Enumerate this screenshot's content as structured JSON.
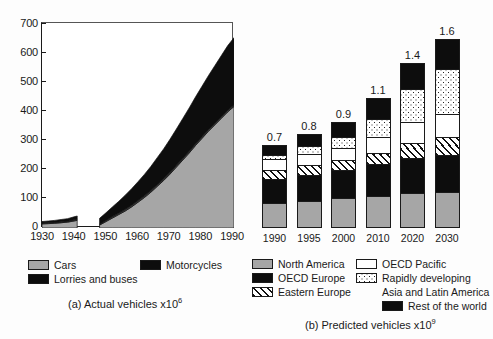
{
  "chart_data": [
    {
      "type": "area",
      "id": "actual-vehicles",
      "title": "(a) Actual vehicles x10^6",
      "caption_main": "(a) Actual vehicles x10",
      "caption_exp": "6",
      "xlabel": "",
      "ylabel": "",
      "xlim": [
        1930,
        1990
      ],
      "ylim": [
        0,
        700
      ],
      "xticks": [
        "1930",
        "1940",
        "1950",
        "1960",
        "1970",
        "1980",
        "1990"
      ],
      "yticks": [
        "0",
        "100",
        "200",
        "300",
        "400",
        "500",
        "600",
        "700"
      ],
      "grid": false,
      "stacked": true,
      "x": [
        1930,
        1932,
        1934,
        1936,
        1938,
        1940,
        1941,
        1942,
        1944,
        1946,
        1948,
        1950,
        1952,
        1954,
        1956,
        1958,
        1960,
        1962,
        1964,
        1966,
        1968,
        1970,
        1972,
        1974,
        1976,
        1978,
        1980,
        1982,
        1984,
        1986,
        1988,
        1990
      ],
      "series": [
        {
          "name": "Cars",
          "fill": "gray",
          "values": [
            14,
            15,
            16,
            18,
            20,
            24,
            26,
            0,
            0,
            0,
            10,
            22,
            34,
            46,
            58,
            72,
            88,
            104,
            122,
            142,
            162,
            184,
            208,
            232,
            256,
            282,
            306,
            330,
            352,
            374,
            396,
            415
          ]
        },
        {
          "name": "Motorcycles",
          "fill": "darkgray",
          "values": [
            3,
            3,
            3,
            3,
            3,
            4,
            4,
            0,
            0,
            0,
            3,
            4,
            5,
            5,
            6,
            6,
            6,
            6,
            6,
            6,
            6,
            6,
            6,
            6,
            6,
            6,
            6,
            6,
            6,
            6,
            6,
            6
          ]
        },
        {
          "name": "Lorries and buses",
          "fill": "black",
          "values": [
            5,
            6,
            7,
            8,
            9,
            10,
            11,
            0,
            0,
            0,
            20,
            26,
            33,
            40,
            48,
            56,
            64,
            73,
            82,
            92,
            102,
            113,
            124,
            136,
            148,
            160,
            172,
            184,
            196,
            208,
            220,
            229
          ]
        }
      ],
      "totals_note": "1990 total approximately 650"
    },
    {
      "type": "bar",
      "id": "predicted-vehicles",
      "title": "(b) Predicted vehicles x10^9",
      "caption_main": "(b) Predicted vehicles x10",
      "caption_exp": "9",
      "xlabel": "",
      "ylabel": "",
      "stacked": true,
      "categories": [
        "1990",
        "1995",
        "2000",
        "2010",
        "2020",
        "2030"
      ],
      "totals": [
        0.7,
        0.8,
        0.9,
        1.1,
        1.4,
        1.6
      ],
      "total_labels": [
        "0.7",
        "0.8",
        "0.9",
        "1.1",
        "1.4",
        "1.6"
      ],
      "series": [
        {
          "name": "North America",
          "fill": "gray",
          "values": [
            0.21,
            0.23,
            0.25,
            0.27,
            0.29,
            0.3
          ]
        },
        {
          "name": "OECD Europe",
          "fill": "black",
          "values": [
            0.22,
            0.23,
            0.25,
            0.28,
            0.3,
            0.32
          ]
        },
        {
          "name": "Eastern Europe",
          "fill": "hatch",
          "values": [
            0.07,
            0.08,
            0.08,
            0.09,
            0.13,
            0.15
          ]
        },
        {
          "name": "OECD Pacific",
          "fill": "white",
          "values": [
            0.09,
            0.09,
            0.1,
            0.13,
            0.17,
            0.19
          ]
        },
        {
          "name": "Rapidly developing Asia and Latin America",
          "fill": "dots",
          "values": [
            0.03,
            0.07,
            0.09,
            0.15,
            0.29,
            0.39
          ]
        },
        {
          "name": "Rest of the world",
          "fill": "black",
          "values": [
            0.08,
            0.1,
            0.13,
            0.18,
            0.22,
            0.25
          ]
        }
      ]
    }
  ],
  "chart_a": {
    "yticks": [
      "700",
      "600",
      "500",
      "400",
      "300",
      "200",
      "100",
      "0"
    ],
    "xticks": [
      "1930",
      "1940",
      "1950",
      "1960",
      "1970",
      "1980",
      "1990"
    ],
    "caption_main": "(a) Actual vehicles x10",
    "caption_exp": "6"
  },
  "chart_b": {
    "caption_main": "(b) Predicted vehicles x10",
    "caption_exp": "9",
    "bars": [
      {
        "label": "1990",
        "value": "0.7"
      },
      {
        "label": "1995",
        "value": "0.8"
      },
      {
        "label": "2000",
        "value": "0.9"
      },
      {
        "label": "2010",
        "value": "1.1"
      },
      {
        "label": "2020",
        "value": "1.4"
      },
      {
        "label": "2030",
        "value": "1.6"
      }
    ]
  },
  "legend_a": {
    "items": [
      {
        "label": "Cars",
        "fill": "gray"
      },
      {
        "label": "Motorcycles",
        "fill": "darkgray"
      },
      {
        "label": "Lorries and buses",
        "fill": "black"
      }
    ]
  },
  "legend_b": {
    "items": [
      {
        "label": "North America",
        "fill": "gray"
      },
      {
        "label": "OECD Europe",
        "fill": "black"
      },
      {
        "label": "Eastern Europe",
        "fill": "hatch"
      },
      {
        "label": "OECD Pacific",
        "fill": "white"
      },
      {
        "label": "Rapidly developing",
        "label2": "Asia and Latin America",
        "fill": "dots"
      },
      {
        "label": "Rest of the world",
        "fill": "black"
      }
    ]
  },
  "colors": {
    "cars_gray": "#a6a6a6",
    "black": "#0d0d0d",
    "white": "#ffffff",
    "axis": "#1a1a1a"
  }
}
